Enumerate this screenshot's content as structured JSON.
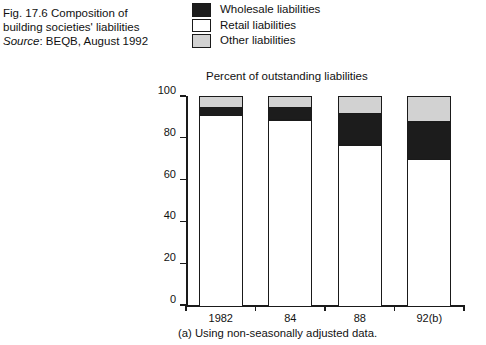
{
  "caption": {
    "line1": "Fig. 17.6  Composition of",
    "line2": "building societies' liabilities",
    "source_label": "Source",
    "source_value": ": BEQB, August 1992"
  },
  "legend": {
    "items": [
      {
        "label": "Wholesale liabilities",
        "swatch": "black",
        "color": "#1c1c1c"
      },
      {
        "label": "Retail liabilities",
        "swatch": "white",
        "color": "#ffffff"
      },
      {
        "label": "Other liabilities",
        "swatch": "light-gray",
        "color": "#d2d2d2"
      }
    ]
  },
  "footnote": "(a) Using non-seasonally adjusted data.",
  "chart_data": {
    "type": "bar",
    "title": "Percent of outstanding liabilities",
    "subtitle": "",
    "xlabel": "",
    "ylabel": "",
    "stacked": true,
    "grid": false,
    "legend_position": "top-center",
    "categories": [
      "1982",
      "84",
      "88",
      "92(b)"
    ],
    "ylim": [
      0,
      100
    ],
    "yticks": [
      0,
      20,
      40,
      60,
      80,
      100
    ],
    "ytick_labels": [
      "0",
      "20",
      "40",
      "60",
      "80",
      "100"
    ],
    "series": [
      {
        "name": "Retail liabilities",
        "color": "#ffffff",
        "values": [
          91,
          89,
          77,
          70
        ]
      },
      {
        "name": "Wholesale liabilities",
        "color": "#1c1c1c",
        "values": [
          4,
          6,
          15,
          18
        ]
      },
      {
        "name": "Other liabilities",
        "color": "#d2d2d2",
        "values": [
          5,
          5,
          8,
          12
        ]
      }
    ]
  }
}
